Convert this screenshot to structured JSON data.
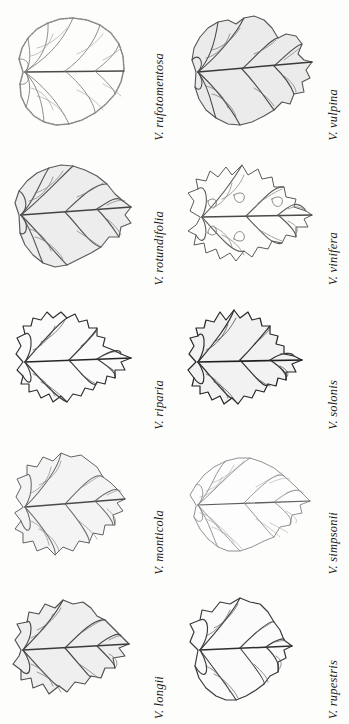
{
  "figure": {
    "type": "botanical-plate",
    "columns": 2,
    "rows": 5,
    "background_color": "#fdfdfc",
    "ink_color": "#2b2b2b",
    "label_color": "#1b1b1b"
  },
  "leaves": [
    {
      "label": "V. rufotomentosa",
      "row": 1,
      "column": 1,
      "shape": "orbicular-entire",
      "lobes": 3,
      "margin": "finely serrate",
      "ink_weight": "light",
      "fill_color": "#fdfdfc",
      "stroke_color": "#6f6f6f",
      "vein_color": "#7a7a7a"
    },
    {
      "label": "V. vulpina",
      "row": 1,
      "column": 2,
      "shape": "cordate-shouldered",
      "lobes": 3,
      "margin": "coarsely dentate",
      "ink_weight": "medium",
      "fill_color": "#ebebeb",
      "stroke_color": "#555555",
      "vein_color": "#4a4a4a"
    },
    {
      "label": "V. rotundifolia",
      "row": 2,
      "column": 1,
      "shape": "broadly cordate",
      "lobes": 1,
      "margin": "coarsely dentate",
      "ink_weight": "medium",
      "fill_color": "#ededed",
      "stroke_color": "#5c5c5c",
      "vein_color": "#555555"
    },
    {
      "label": "V. vinifera",
      "row": 2,
      "column": 2,
      "shape": "deeply 5-lobed",
      "lobes": 5,
      "margin": "dentate with closed sinuses",
      "ink_weight": "light",
      "fill_color": "#fdfdfc",
      "stroke_color": "#5a5a5a",
      "vein_color": "#616161"
    },
    {
      "label": "V. riparia",
      "row": 3,
      "column": 1,
      "shape": "cordate acuminate",
      "lobes": 3,
      "margin": "sharply serrate",
      "ink_weight": "dark",
      "fill_color": "#fbfbfb",
      "stroke_color": "#2e2e2e",
      "vein_color": "#3a3a3a"
    },
    {
      "label": "V. solonis",
      "row": 3,
      "column": 2,
      "shape": "broadly cordate",
      "lobes": 3,
      "margin": "sharply serrate",
      "ink_weight": "dark",
      "fill_color": "#f2f2f2",
      "stroke_color": "#262626",
      "vein_color": "#303030"
    },
    {
      "label": "V. monticola",
      "row": 4,
      "column": 1,
      "shape": "orbicular-reniform",
      "lobes": 3,
      "margin": "crenate",
      "ink_weight": "light",
      "fill_color": "#f4f4f4",
      "stroke_color": "#636363",
      "vein_color": "#6a6a6a"
    },
    {
      "label": "V. simpsonii",
      "row": 4,
      "column": 2,
      "shape": "cordate long-acuminate",
      "lobes": 1,
      "margin": "finely serrate",
      "ink_weight": "very light",
      "fill_color": "#fdfdfd",
      "stroke_color": "#7d7d7d",
      "vein_color": "#8a8a8a"
    },
    {
      "label": "V. longii",
      "row": 5,
      "column": 1,
      "shape": "cordate",
      "lobes": 3,
      "margin": "coarsely dentate",
      "ink_weight": "medium",
      "fill_color": "#efefef",
      "stroke_color": "#4e4e4e",
      "vein_color": "#474747"
    },
    {
      "label": "V. rupestris",
      "row": 5,
      "column": 2,
      "shape": "reniform wider-than-long",
      "lobes": 1,
      "margin": "broadly dentate",
      "ink_weight": "medium-dark",
      "fill_color": "#fbfbfb",
      "stroke_color": "#3a3a3a",
      "vein_color": "#3f3f3f"
    }
  ]
}
